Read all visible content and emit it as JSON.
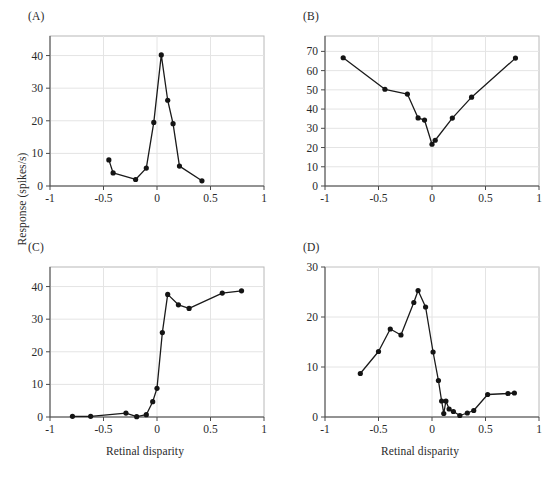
{
  "figure": {
    "y_axis_label": "Response (spikes/s)",
    "x_axis_label": "Retinal disparity",
    "panel_labels": {
      "a": "(A)",
      "b": "(B)",
      "c": "(C)",
      "d": "(D)"
    }
  },
  "chart_data": [
    {
      "id": "A",
      "panel": "(A)",
      "type": "line",
      "title": "",
      "xlabel": "Retinal disparity",
      "ylabel": "Response (spikes/s)",
      "xlim": [
        -1,
        1
      ],
      "ylim": [
        0,
        46
      ],
      "xticks": [
        -1,
        -0.5,
        0,
        0.5,
        1
      ],
      "xticklabels": [
        "-1",
        "-0.5",
        "0",
        "0.5",
        "1"
      ],
      "yticks": [
        0,
        10,
        20,
        30,
        40
      ],
      "yticklabels": [
        "0",
        "10",
        "20",
        "30",
        "40"
      ],
      "grid": true,
      "legend": "none",
      "marker": "filled-circle",
      "x": [
        -0.45,
        -0.41,
        -0.2,
        -0.1,
        -0.03,
        0.04,
        0.1,
        0.15,
        0.21,
        0.42
      ],
      "y": [
        8.0,
        4.0,
        2.0,
        5.5,
        19.5,
        40.2,
        26.3,
        19.1,
        6.1,
        1.6
      ],
      "x_peak": 0.04,
      "y_peak": 40.2
    },
    {
      "id": "B",
      "panel": "(B)",
      "type": "line",
      "title": "",
      "xlabel": "Retinal disparity",
      "ylabel": "Response (spikes/s)",
      "xlim": [
        -1,
        1
      ],
      "ylim": [
        0,
        78
      ],
      "xticks": [
        -1,
        -0.5,
        0,
        0.5,
        1
      ],
      "xticklabels": [
        "-1",
        "-0.5",
        "0",
        "0.5",
        "1"
      ],
      "yticks": [
        0,
        10,
        20,
        30,
        40,
        50,
        60,
        70
      ],
      "yticklabels": [
        "0",
        "10",
        "20",
        "30",
        "40",
        "50",
        "60",
        "70"
      ],
      "grid": true,
      "legend": "none",
      "marker": "filled-circle",
      "x": [
        -0.83,
        -0.44,
        -0.23,
        -0.13,
        -0.07,
        0.0,
        0.03,
        0.19,
        0.37,
        0.78
      ],
      "y": [
        66.7,
        50.3,
        47.8,
        35.4,
        34.3,
        21.7,
        23.8,
        35.3,
        46.2,
        66.5
      ],
      "x_min": 0.0,
      "y_min": 21.7
    },
    {
      "id": "C",
      "panel": "(C)",
      "type": "line",
      "title": "",
      "xlabel": "Retinal disparity",
      "ylabel": "Response (spikes/s)",
      "xlim": [
        -1,
        1
      ],
      "ylim": [
        0,
        46
      ],
      "xticks": [
        -1,
        -0.5,
        0,
        0.5,
        1
      ],
      "xticklabels": [
        "-1",
        "-0.5",
        "0",
        "0.5",
        "1"
      ],
      "yticks": [
        0,
        10,
        20,
        30,
        40
      ],
      "yticklabels": [
        "0",
        "10",
        "20",
        "30",
        "40"
      ],
      "grid": true,
      "legend": "none",
      "marker": "filled-circle",
      "x": [
        -0.79,
        -0.62,
        -0.29,
        -0.19,
        -0.1,
        -0.04,
        0.0,
        0.05,
        0.1,
        0.2,
        0.3,
        0.61,
        0.79
      ],
      "y": [
        0.2,
        0.2,
        1.2,
        0.1,
        0.7,
        4.7,
        8.8,
        25.9,
        37.6,
        34.4,
        33.3,
        38.0,
        38.7
      ],
      "x_max": 0.79,
      "y_max": 38.7
    },
    {
      "id": "D",
      "panel": "(D)",
      "type": "line",
      "title": "",
      "xlabel": "Retinal disparity",
      "ylabel": "Response (spikes/s)",
      "xlim": [
        -1,
        1
      ],
      "ylim": [
        0,
        30
      ],
      "xticks": [
        -1,
        -0.5,
        0,
        0.5,
        1
      ],
      "xticklabels": [
        "-1",
        "-0.5",
        "0",
        "0.5",
        "1"
      ],
      "yticks": [
        0,
        10,
        20,
        30
      ],
      "yticklabels": [
        "0",
        "10",
        "20",
        "30"
      ],
      "grid": true,
      "legend": "none",
      "marker": "filled-circle",
      "x": [
        -0.67,
        -0.5,
        -0.39,
        -0.29,
        -0.17,
        -0.13,
        -0.06,
        0.01,
        0.06,
        0.09,
        0.11,
        0.13,
        0.16,
        0.2,
        0.26,
        0.33,
        0.39,
        0.52,
        0.71,
        0.77
      ],
      "y": [
        8.7,
        13.1,
        17.6,
        16.4,
        22.9,
        25.3,
        22.0,
        13.0,
        7.3,
        3.2,
        0.7,
        3.2,
        1.6,
        1.1,
        0.3,
        0.8,
        1.3,
        4.5,
        4.7,
        4.8
      ],
      "x_peak": -0.13,
      "y_peak": 25.3
    }
  ]
}
